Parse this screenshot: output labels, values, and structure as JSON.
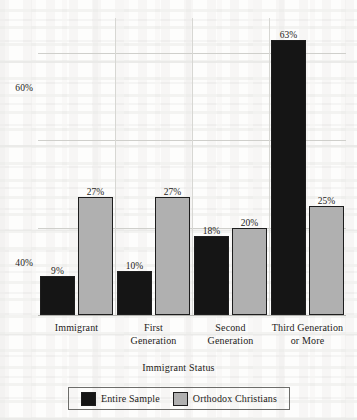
{
  "chart_data": {
    "type": "bar",
    "title": "",
    "xlabel": "Immigrant Status",
    "ylabel": "",
    "categories": [
      "Immigrant",
      "First Generation",
      "Second Generation",
      "Third Generation or More"
    ],
    "category_lines": [
      [
        "Immigrant"
      ],
      [
        "First",
        "Generation"
      ],
      [
        "Second",
        "Generation"
      ],
      [
        "Third Generation",
        "or More"
      ]
    ],
    "series": [
      {
        "name": "Entire Sample",
        "color": "#151515",
        "values": [
          9,
          10,
          18,
          63
        ],
        "labels": [
          "9%",
          "10%",
          "18%",
          "63%"
        ]
      },
      {
        "name": "Orthodox Christians",
        "color": "#b0b0b0",
        "values": [
          27,
          27,
          20,
          25
        ],
        "labels": [
          "27%",
          "27%",
          "20%",
          "25%"
        ]
      }
    ],
    "ylim": [
      0,
      68
    ],
    "yticks": [
      0,
      20,
      40,
      60
    ],
    "ytick_labels": [
      "0%",
      "20%",
      "40%",
      "60%"
    ],
    "grid": true,
    "legend_position": "bottom"
  }
}
